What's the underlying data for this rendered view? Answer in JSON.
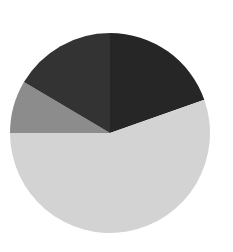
{
  "chart_data": {
    "type": "pie",
    "title": "",
    "legend": [],
    "start_angle_deg": 0,
    "direction": "clockwise",
    "center": [
      110,
      133
    ],
    "radius": 100,
    "slices": [
      {
        "label": "",
        "value": 19.6,
        "color": "#262626"
      },
      {
        "label": "",
        "value": 55.4,
        "color": "#d3d3d3"
      },
      {
        "label": "",
        "value": 8.5,
        "color": "#8c8c8c"
      },
      {
        "label": "",
        "value": 16.5,
        "color": "#333333"
      }
    ],
    "values": [
      19.6,
      55.4,
      8.5,
      16.5
    ],
    "categories": [
      "",
      "",
      "",
      ""
    ]
  }
}
